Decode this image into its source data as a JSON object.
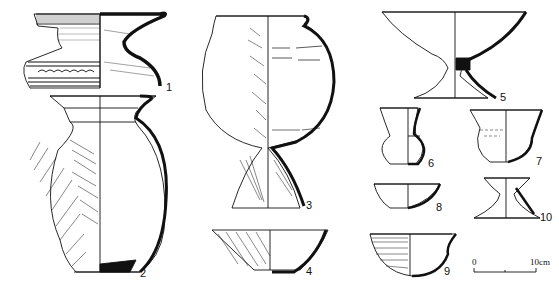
{
  "figure": {
    "vessels": [
      {
        "id": "1",
        "label": "1"
      },
      {
        "id": "2",
        "label": "2"
      },
      {
        "id": "3",
        "label": "3"
      },
      {
        "id": "4",
        "label": "4"
      },
      {
        "id": "5",
        "label": "5"
      },
      {
        "id": "6",
        "label": "6"
      },
      {
        "id": "7",
        "label": "7"
      },
      {
        "id": "8",
        "label": "8"
      },
      {
        "id": "9",
        "label": "9"
      },
      {
        "id": "10",
        "label": "10"
      }
    ],
    "scale_bar": {
      "start_label": "0",
      "end_label": "10cm"
    }
  },
  "colors": {
    "ink": "#111111",
    "background": "#ffffff"
  }
}
